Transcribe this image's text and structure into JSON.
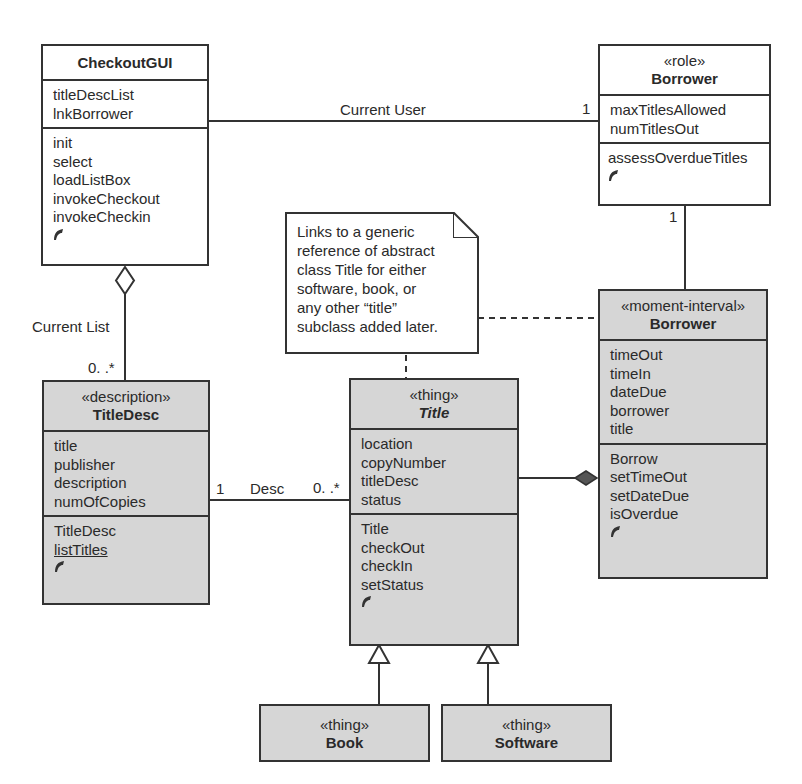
{
  "diagram": {
    "type": "uml-class-diagram",
    "colors": {
      "line": "#333333",
      "shaded_fill": "#d6d6d6",
      "plain_fill": "#ffffff"
    },
    "classes": {
      "checkout_gui": {
        "stereotype": "",
        "name": "CheckoutGUI",
        "attributes": [
          "titleDescList",
          "lnkBorrower"
        ],
        "operations": [
          "init",
          "select",
          "loadListBox",
          "invokeCheckout",
          "invokeCheckin"
        ],
        "more_icon": "more-indicator-icon"
      },
      "borrower_role": {
        "stereotype": "«role»",
        "name": "Borrower",
        "attributes": [
          "maxTitlesAllowed",
          "numTitlesOut"
        ],
        "operations": [
          "assessOverdueTitles"
        ],
        "more_icon": "more-indicator-icon"
      },
      "borrower_mi": {
        "stereotype": "«moment-interval»",
        "name": "Borrower",
        "attributes": [
          "timeOut",
          "timeIn",
          "dateDue",
          "borrower",
          "title"
        ],
        "operations": [
          "Borrow",
          "setTimeOut",
          "setDateDue",
          "isOverdue"
        ],
        "more_icon": "more-indicator-icon"
      },
      "title_desc": {
        "stereotype": "«description»",
        "name": "TitleDesc",
        "attributes": [
          "title",
          "publisher",
          "description",
          "numOfCopies"
        ],
        "operations": [
          "TitleDesc",
          "listTitles"
        ],
        "static_operations": [
          "listTitles"
        ],
        "more_icon": "more-indicator-icon"
      },
      "title": {
        "stereotype": "«thing»",
        "name": "Title",
        "abstract": true,
        "attributes": [
          "location",
          "copyNumber",
          "titleDesc",
          "status"
        ],
        "operations": [
          "Title",
          "checkOut",
          "checkIn",
          "setStatus"
        ],
        "more_icon": "more-indicator-icon"
      },
      "book": {
        "stereotype": "«thing»",
        "name": "Book"
      },
      "software": {
        "stereotype": "«thing»",
        "name": "Software"
      }
    },
    "note": {
      "lines": [
        "Links to a generic",
        "reference of abstract",
        "class Title for either",
        "software, book, or",
        "any other “title”",
        "subclass added later."
      ]
    },
    "associations": {
      "current_user": {
        "label": "Current User",
        "multiplicity_borrower": "1"
      },
      "role_to_mi": {
        "multiplicity_role": "1"
      },
      "current_list": {
        "label": "Current List",
        "multiplicity_titledesc": "0. .*",
        "kind": "aggregation"
      },
      "desc": {
        "label": "Desc",
        "multiplicity_titledesc": "1",
        "multiplicity_title": "0. .*"
      },
      "title_to_borrow": {
        "kind": "composition"
      },
      "generalizations": [
        "Book → Title",
        "Software → Title"
      ]
    }
  }
}
